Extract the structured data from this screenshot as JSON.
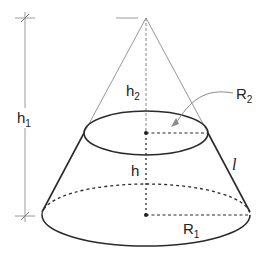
{
  "diagram": {
    "colors": {
      "outline": "#2a2a2a",
      "construction": "#8a8a8a",
      "text": "#222222",
      "background": "#ffffff"
    },
    "labels": {
      "h1": {
        "base": "h",
        "sub": "1"
      },
      "h2": {
        "base": "h",
        "sub": "2"
      },
      "h": {
        "base": "h"
      },
      "R1": {
        "base": "R",
        "sub": "1"
      },
      "R2": {
        "base": "R",
        "sub": "2"
      },
      "l": {
        "base": "l"
      }
    }
  }
}
